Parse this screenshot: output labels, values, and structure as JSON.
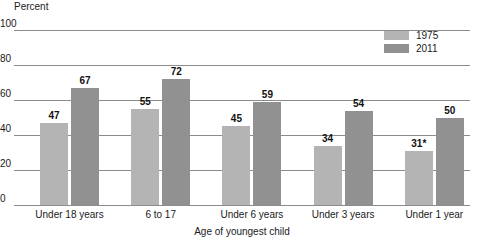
{
  "chart_data": {
    "type": "bar",
    "title": "",
    "subtitle": "",
    "xlabel": "Age of youngest child",
    "ylabel": "Percent",
    "ylim": [
      0,
      100
    ],
    "yticks": [
      0,
      20,
      40,
      60,
      80,
      100
    ],
    "ytick_labels": [
      "0",
      "20",
      "40",
      "60",
      "80",
      "100"
    ],
    "grid": "horizontal",
    "legend_position": "top-right",
    "categories": [
      "Under 18 years",
      "6 to 17",
      "Under 6 years",
      "Under 3 years",
      "Under 1 year"
    ],
    "series": [
      {
        "name": "1975",
        "color": "#b4b4b4",
        "values": [
          47,
          55,
          45,
          34,
          31
        ],
        "labels": [
          "47",
          "55",
          "45",
          "34",
          "31*"
        ]
      },
      {
        "name": "2011",
        "color": "#919191",
        "values": [
          67,
          72,
          59,
          54,
          50
        ],
        "labels": [
          "67",
          "72",
          "59",
          "54",
          "50"
        ]
      }
    ],
    "annotations": [
      "* asterisk on 1975 value for Under 1 year"
    ]
  },
  "legend": {
    "items": [
      {
        "label": "1975",
        "color": "#b4b4b4"
      },
      {
        "label": "2011",
        "color": "#919191"
      }
    ]
  },
  "axis": {
    "y_title": "Percent",
    "x_title": "Age of youngest child"
  }
}
